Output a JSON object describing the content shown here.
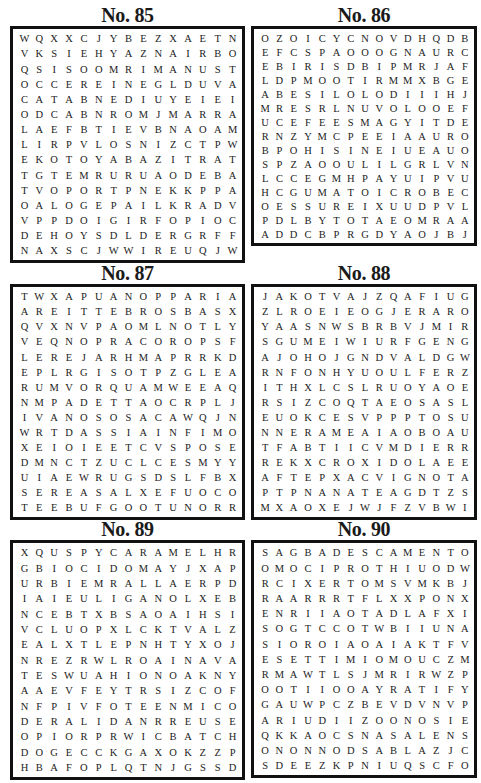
{
  "puzzles": [
    {
      "title": "No. 85",
      "rows": [
        "WQXXCJYBEZXAETN",
        "VKSIEHYAZNAIRBO",
        "QSISOOMRIMANUST",
        "OCCEREINEGLDUVA",
        "CATABNEDIUYEIEI",
        "ODCABNROMJMARRA",
        "LAEFBTIEVBNAOAM",
        "LIRPVLOSNIZCTPW",
        "EKOTOYABAZITRAT",
        "TGTEMRURUAODEBA",
        "TVOPORTPNEKKPPA",
        "OALOGEPAILKRADV",
        "VPPDOIGIRFOPIOC",
        "DEHOYSDLDERGRFF",
        "NAXSCJWWIREUQJW"
      ]
    },
    {
      "title": "No. 86",
      "rows": [
        "OZOICYCNOVDHQDB",
        "EFCSPAOOOGNAURC",
        "EBIRISDBIPMRJAF",
        "LDPMOOTIRMMXBGE",
        "ABESILOLODIIIHJ",
        "MRESRLNUVOLOOEF",
        "UCEFEESMAGYITDE",
        "RNZYMCPEEIAAURO",
        "BPOHISINEIUEAUO",
        "SPZAOOULILGRLVN",
        "LCCEGMHPAYUIPVU",
        "HCGUMATOICROBEC",
        "OESSUREIXUUDPVL",
        "PDLBYTOTAEOMRAA",
        "ADDCBPRGDYAOJBJ"
      ]
    },
    {
      "title": "No. 87",
      "rows": [
        "TWXAPUANOPPARIA",
        "AREITTEBROSBASX",
        "QVXNVPAOMLNOTLY",
        "VEQNOPRACOROPSF",
        "LEREJARHMAPRRKD",
        "EPLRGISOTPZGLEA",
        "RUMVORQUAMWEEAQ",
        "NMPADETTAOCRPLJ",
        "IVANOSOSACAWQJN",
        "WRTDASSIAINFIMO",
        "XEIOIEETCVSPOSE",
        "DMNCTZUCLCESMYY",
        "UIAEWRUGSDSLFBX",
        "SEREASALXEFUOCO",
        "TEEBUFGOOTUNORR"
      ]
    },
    {
      "title": "No. 88",
      "rows": [
        "JAKOTVAJZQAFIUG",
        "ZLROEIEOGJERARO",
        "YAASNWSBRBVJMIR",
        "SGUMEIWIURFGENG",
        "AJOHOJGNDVALDGW",
        "RNFONHYUOULFERZ",
        "ITHXLCSLRUOYAOE",
        "RSIZCOQTAEOSASL",
        "EUOKCESVPPPTOSU",
        "NNERAMEAIAOBOAU",
        "TFABTIICVMDIERR",
        "REKXCROXIDOLAEE",
        "AFTEPXACVIGNOTA",
        "PTPNANATEAGDTZS",
        "MXAOXEJWJFZVBWI"
      ]
    },
    {
      "title": "No. 89",
      "rows": [
        "XQUSPYCARAMELHR",
        "GBIOCIDOMAYJXAP",
        "URBIEMRALLAERPD",
        "IAIEULIGANOLXEB",
        "NCEBTXBSAOAIHSI",
        "VCLUOPXLCKTVALZ",
        "EALXTLEPNHTYXOJ",
        "NREZRWLROAINAVA",
        "TESWUAHIONOAKNY",
        "AAEVFEYTRSIZCOF",
        "NFPIVFOTEENMICO",
        "DERALIDANRREUSE",
        "OPIORPRWICBATCH",
        "DOGECCKGAXOKZZP",
        "HBAFOPLQTNJGSSD"
      ]
    },
    {
      "title": "No. 90",
      "rows": [
        "SAGBADESCAMENTO",
        "OMOCIPROTHIUODW",
        "RCIXERTOMSVMKBJ",
        "RAARRRTFLXXPONX",
        "ENRIIAOTADLAFXI",
        "SOGTCCOTWBIIUNA",
        "SIOROIAOAIAKTFV",
        "ESETTIMIOMOUCZM",
        "RMAWTLSJMRIRWZP",
        "OOTIIOOAYRATIFY",
        "GAUWPCZBEVDVNVP",
        "ARIUDIIZOONOSIE",
        "QKKAOCSNASALENS",
        "ONONNODSABLAZJC",
        "SDEEZKPNIUQSCFO"
      ]
    }
  ]
}
